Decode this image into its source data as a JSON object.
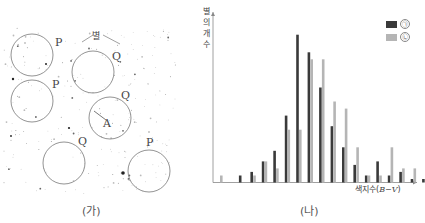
{
  "panel_a": {
    "caption": "(가)",
    "star_label": "별",
    "circles": [
      {
        "label": "P",
        "cx": 32,
        "cy": 55,
        "r": 21,
        "lx": 55,
        "ly": 36
      },
      {
        "label": "P",
        "cx": 32,
        "cy": 101,
        "r": 21,
        "lx": 52,
        "ly": 78
      },
      {
        "label": "Q",
        "cx": 93,
        "cy": 72,
        "r": 21,
        "lx": 112,
        "ly": 50
      },
      {
        "label": "Q",
        "cx": 110,
        "cy": 118,
        "r": 21,
        "lx": 121,
        "ly": 89
      },
      {
        "label": "Q",
        "cx": 64,
        "cy": 163,
        "r": 21,
        "lx": 78,
        "ly": 135
      },
      {
        "label": "P",
        "cx": 149,
        "cy": 171,
        "r": 21,
        "lx": 146,
        "ly": 136
      }
    ],
    "point_label": "A"
  },
  "panel_b": {
    "caption": "(나)",
    "ylabel": "별의 개수",
    "xlabel_prefix": "색지수(",
    "xlabel_var": "B−V",
    "xlabel_suffix": ")",
    "legend": [
      {
        "mark": "㉠",
        "color": "#3a3a3a"
      },
      {
        "mark": "㉡",
        "color": "#b5b5b5"
      }
    ]
  },
  "chart_data": {
    "type": "bar",
    "title": "",
    "xlabel": "색지수(B−V)",
    "ylabel": "별의 개수",
    "categories": [
      "1",
      "2",
      "3",
      "4",
      "5",
      "6",
      "7",
      "8",
      "9",
      "10",
      "11",
      "12",
      "13",
      "14",
      "15",
      "16",
      "17",
      "18"
    ],
    "series": [
      {
        "name": "㉠",
        "color": "#3a3a3a",
        "values": [
          0,
          2,
          3,
          6,
          9,
          19,
          42,
          37,
          27,
          16,
          10,
          5,
          2,
          6,
          2,
          3,
          1,
          1
        ]
      },
      {
        "name": "㉡",
        "color": "#b5b5b5",
        "values": [
          2,
          0,
          2,
          6,
          4,
          15,
          15,
          35,
          35,
          23,
          21,
          10,
          2,
          2,
          10,
          4,
          4,
          0
        ]
      }
    ],
    "ylim": [
      0,
      48
    ],
    "grid": false,
    "tick_labels": false,
    "legend_position": "top-right"
  }
}
